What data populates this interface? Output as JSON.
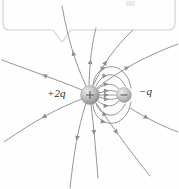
{
  "figure": {
    "type": "electric-field-line-diagram",
    "background_color": "#fefefe",
    "line_color": "#8f8f8f",
    "callout_color": "#cfcfcf"
  },
  "callout": {
    "name": "annotation-callout-box",
    "shape": "rounded-rectangle-with-tail",
    "x": 3,
    "y": -22,
    "width": 172,
    "height": 52,
    "tail_x": 62,
    "tail_y": 30,
    "text": ""
  },
  "ghost_text": {
    "label": "",
    "note": "faint clipped text remnant at top edge"
  },
  "charges": [
    {
      "name": "positive-charge",
      "label": "+2q",
      "sign": "+",
      "cx": 90,
      "cy": 95,
      "r": 9.5,
      "color_light": "#d6d6d6",
      "color_dark": "#8e8e8e",
      "label_x": 47,
      "label_y": 87
    },
    {
      "name": "negative-charge",
      "label": "−q",
      "sign": "−",
      "cx": 124,
      "cy": 95,
      "r": 7.5,
      "color_light": "#d9d9d9",
      "color_dark": "#9a9a9a",
      "label_x": 139,
      "label_y": 85
    }
  ],
  "chart_data": {
    "type": "diagram",
    "xlabel": "",
    "ylabel": "",
    "annotations": [
      "+2q",
      "−q"
    ],
    "source_charge": {
      "charge": 2,
      "x": 90,
      "y": 95
    },
    "sink_charge": {
      "charge": -1,
      "x": 124,
      "y": 95
    },
    "field_lines_total": 16,
    "lines_terminating_on_negative": 8,
    "lines_escaping_to_infinity": 8,
    "arrow_direction": "away from +2q, into -q",
    "legend": []
  },
  "field_lines": [
    {
      "name": "line-bound-1",
      "d": "M 99 93 C 108 90 112 90 117 92",
      "arrows": [
        {
          "t": 0.55,
          "rot": -12
        }
      ]
    },
    {
      "name": "line-bound-2",
      "d": "M 99 95 C 108 95 112 95 117 95",
      "arrows": [
        {
          "t": 0.55,
          "rot": 0
        }
      ]
    },
    {
      "name": "line-bound-3",
      "d": "M 99 97 C 108 100 112 100 117 98",
      "arrows": [
        {
          "t": 0.55,
          "rot": 12
        }
      ]
    },
    {
      "name": "line-bound-4",
      "d": "M 98 89 C 106 82 114 83 119 89",
      "arrows": [
        {
          "t": 0.5,
          "rot": -28
        }
      ]
    },
    {
      "name": "line-bound-5",
      "d": "M 98 101 C 106 108 114 107 119 101",
      "arrows": [
        {
          "t": 0.5,
          "rot": 28
        }
      ]
    },
    {
      "name": "line-bound-6",
      "d": "M 96 86 C 102 72 118 70 125 86",
      "arrows": [
        {
          "t": 0.42,
          "rot": -45
        }
      ]
    },
    {
      "name": "line-bound-7",
      "d": "M 96 104 C 102 118 118 120 125 104",
      "arrows": [
        {
          "t": 0.42,
          "rot": 45
        }
      ]
    },
    {
      "name": "line-bound-8",
      "d": "M 93 85 C 95 62 126 58 131 88",
      "arrows": [
        {
          "t": 0.38,
          "rot": -55
        }
      ]
    },
    {
      "name": "line-bound-9",
      "d": "M 93 105 C 95 128 126 132 131 102",
      "arrows": [
        {
          "t": 0.38,
          "rot": 55
        }
      ]
    },
    {
      "name": "line-far-1",
      "d": "M 86 86 C 74 60 68 38 62 6",
      "arrows": [
        {
          "t": 0.45,
          "rot": -72
        }
      ]
    },
    {
      "name": "line-far-2",
      "d": "M 89 85 C 90 58 92 44 96 28",
      "arrows": [
        {
          "t": 0.45,
          "rot": -82
        }
      ]
    },
    {
      "name": "line-far-3",
      "d": "M 93 86 C 104 62 116 46 133 30",
      "arrows": [
        {
          "t": 0.42,
          "rot": -52
        }
      ]
    },
    {
      "name": "line-far-4",
      "d": "M 97 88 C 120 70 146 56 178 44",
      "arrows": [
        {
          "t": 0.42,
          "rot": -28
        }
      ]
    },
    {
      "name": "line-far-5",
      "d": "M 82 90 C 58 80 34 72 2 60",
      "arrows": [
        {
          "t": 0.5,
          "rot": 160
        }
      ]
    },
    {
      "name": "line-far-6",
      "d": "M 82 99 C 58 108 36 120 4 142",
      "arrows": [
        {
          "t": 0.5,
          "rot": 146
        }
      ]
    },
    {
      "name": "line-far-7",
      "d": "M 86 103 C 78 128 74 152 70 188",
      "arrows": [
        {
          "t": 0.45,
          "rot": 100
        }
      ]
    },
    {
      "name": "line-far-8",
      "d": "M 91 104 C 94 130 96 152 98 178",
      "arrows": [
        {
          "t": 0.42,
          "rot": 85
        }
      ]
    },
    {
      "name": "line-far-9",
      "d": "M 96 103 C 112 126 126 146 150 176",
      "arrows": [
        {
          "t": 0.42,
          "rot": 56
        }
      ]
    },
    {
      "name": "line-far-10",
      "d": "M 130 108 C 146 118 162 126 178 132",
      "arrows": [
        {
          "t": 0.4,
          "rot": 196
        }
      ]
    }
  ]
}
